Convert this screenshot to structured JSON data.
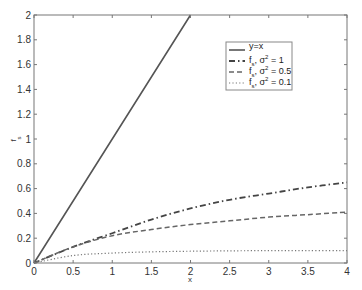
{
  "chart_data": {
    "type": "line",
    "title": "",
    "xlabel": "x",
    "ylabel": "f_s",
    "xlim": [
      0,
      4
    ],
    "ylim": [
      0,
      2
    ],
    "grid": false,
    "legend_position": "upper right (inside)",
    "xticks": [
      "0",
      "0.5",
      "1",
      "1.5",
      "2",
      "2.5",
      "3",
      "3.5",
      "4"
    ],
    "yticks": [
      "0",
      "0.2",
      "0.4",
      "0.6",
      "0.8",
      "1",
      "1.2",
      "1.4",
      "1.6",
      "1.8",
      "2"
    ],
    "x": [
      0,
      0.5,
      1,
      1.5,
      2,
      2.5,
      3,
      3.5,
      4
    ],
    "series": [
      {
        "name": "y=x",
        "style": "solid",
        "color": "#555555",
        "x": [
          0,
          2
        ],
        "values": [
          0,
          2
        ]
      },
      {
        "name": "f_s, σ² = 1",
        "style": "dashdot",
        "color": "#444444",
        "values": [
          0,
          0.13,
          0.24,
          0.35,
          0.44,
          0.51,
          0.56,
          0.61,
          0.65
        ]
      },
      {
        "name": "f_s, σ² = 0.5",
        "style": "dashed",
        "color": "#666666",
        "values": [
          0,
          0.13,
          0.22,
          0.27,
          0.31,
          0.34,
          0.37,
          0.39,
          0.41
        ]
      },
      {
        "name": "f_s, σ² = 0.1",
        "style": "dotted",
        "color": "#777777",
        "values": [
          0,
          0.06,
          0.08,
          0.09,
          0.095,
          0.098,
          0.1,
          0.1,
          0.1
        ]
      }
    ]
  },
  "labels": {
    "xlabel": "x",
    "ylabel_main": "f",
    "ylabel_sub": "s",
    "legend": [
      {
        "main": "y=x",
        "sup": ""
      },
      {
        "main": "f",
        "sub": "s",
        "rest": ", σ",
        "sup": "2",
        "tail": " = 1"
      },
      {
        "main": "f",
        "sub": "s",
        "rest": ", σ",
        "sup": "2",
        "tail": " = 0.5"
      },
      {
        "main": "f",
        "sub": "s",
        "rest": ", σ",
        "sup": "2",
        "tail": " = 0.1"
      }
    ]
  }
}
